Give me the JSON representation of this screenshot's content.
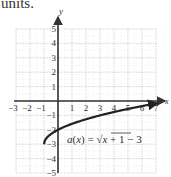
{
  "caption": "units.",
  "chart_data": {
    "type": "line",
    "title": "",
    "function_label": "a(x) = √(x + 1) − 3",
    "function_label_parts": {
      "lhs": "a(x) =",
      "radicand": "x + 1",
      "tail": "− 3"
    },
    "xlabel": "x",
    "ylabel": "y",
    "xlim": [
      -3,
      7
    ],
    "ylim": [
      -5,
      5
    ],
    "grid": true,
    "x_ticks": [
      "-3",
      "-2",
      "-1",
      "1",
      "2",
      "3",
      "4",
      "5",
      "6",
      "7"
    ],
    "y_ticks": [
      "5",
      "4",
      "3",
      "2",
      "1",
      "-1",
      "-2",
      "-3",
      "-4",
      "-5"
    ],
    "series": [
      {
        "name": "a(x) = √(x + 1) − 3",
        "x": [
          -1,
          -0.75,
          0,
          1,
          2,
          3,
          4,
          5,
          6,
          7
        ],
        "y": [
          -3,
          -2.5,
          -2,
          -1.59,
          -1.27,
          -1,
          -0.76,
          -0.55,
          -0.35,
          -0.17
        ],
        "start_point": [
          -1,
          -3
        ],
        "end": "arrow"
      }
    ],
    "colors": {
      "curve": "#222222",
      "axis": "#333333",
      "grid": "#b0b0b0"
    }
  }
}
